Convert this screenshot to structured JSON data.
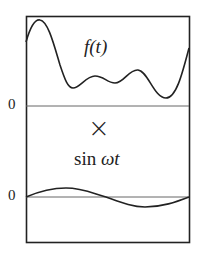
{
  "diagram": {
    "top_panel": {
      "label": "f(t)",
      "zero_label": "0"
    },
    "operator": "×",
    "bottom_panel": {
      "label_prefix": "sin ",
      "label_symbol": "ω",
      "label_var": "t",
      "zero_label": "0"
    },
    "colors": {
      "stroke": "#222222",
      "axis": "#555555",
      "background": "#ffffff"
    }
  }
}
